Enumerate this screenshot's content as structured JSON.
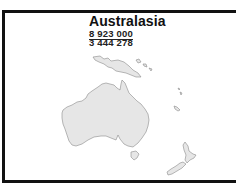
{
  "map": {
    "region_title": "Australasia",
    "figures": [
      {
        "value": "8 923 000",
        "underlined": true
      },
      {
        "value": "3 444 278",
        "underlined": false
      }
    ],
    "regions_depicted": [
      "Australia",
      "New Guinea",
      "Tasmania",
      "New Zealand",
      "Pacific islands"
    ],
    "colors": {
      "land_fill": "#e6e6e6",
      "coastline": "#8a8a8a",
      "frame": "#111111",
      "text": "#111111"
    }
  }
}
